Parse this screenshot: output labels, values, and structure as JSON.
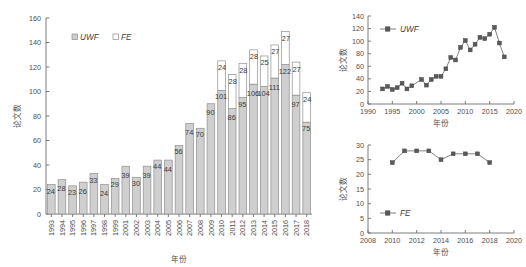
{
  "chart_data": [
    {
      "id": "stacked-bar",
      "type": "bar",
      "title": "",
      "stacked": true,
      "xlabel": "年份",
      "ylabel": "论文数",
      "ylim": [
        0,
        160
      ],
      "yticks": [
        0,
        20,
        40,
        60,
        80,
        100,
        120,
        140,
        160
      ],
      "grid": false,
      "legend": [
        "UWF",
        "FE"
      ],
      "legend_position": "top-left",
      "categories": [
        "1993",
        "1994",
        "1995",
        "1996",
        "1997",
        "1998",
        "1999",
        "2001",
        "2002",
        "2003",
        "2004",
        "2005",
        "2006",
        "2007",
        "2008",
        "2009",
        "2010",
        "2011",
        "2012",
        "2013",
        "2014",
        "2015",
        "2016",
        "2017",
        "2018"
      ],
      "series": [
        {
          "name": "UWF",
          "values": [
            24,
            28,
            23,
            26,
            33,
            24,
            29,
            39,
            30,
            39,
            44,
            44,
            56,
            74,
            70,
            90,
            101,
            86,
            95,
            106,
            104,
            111,
            122,
            97,
            75
          ],
          "labels": [
            "24",
            "28",
            "23",
            "26",
            "33",
            "24",
            "29",
            "39",
            "30",
            "39",
            "44",
            "44",
            "56",
            "74",
            "70",
            "90",
            "101",
            "86",
            "95",
            "106",
            "104",
            "111",
            "122",
            "97",
            "75"
          ]
        },
        {
          "name": "FE",
          "values": [
            0,
            0,
            0,
            0,
            0,
            0,
            0,
            0,
            0,
            0,
            0,
            0,
            0,
            0,
            0,
            0,
            24,
            28,
            28,
            28,
            25,
            27,
            27,
            27,
            24
          ],
          "labels": [
            "",
            "",
            "",
            "",
            "",
            "",
            "",
            "",
            "",
            "",
            "",
            "",
            "",
            "",
            "",
            "",
            "24",
            "28",
            "28",
            "28",
            "25",
            "27",
            "27",
            "27",
            "24"
          ]
        }
      ]
    },
    {
      "id": "uwf-line",
      "type": "line",
      "title": "",
      "xlabel": "年份",
      "ylabel": "论文数",
      "xlim": [
        1990,
        2020
      ],
      "ylim": [
        0,
        140
      ],
      "xticks": [
        1990,
        1995,
        2000,
        2005,
        2010,
        2015,
        2020
      ],
      "yticks": [
        0,
        20,
        40,
        60,
        80,
        100,
        120,
        140
      ],
      "grid": false,
      "legend": [
        "UWF"
      ],
      "legend_position": "top-left",
      "x": [
        1993,
        1994,
        1995,
        1996,
        1997,
        1998,
        1999,
        2001,
        2002,
        2003,
        2004,
        2005,
        2006,
        2007,
        2008,
        2009,
        2010,
        2011,
        2012,
        2013,
        2014,
        2015,
        2016,
        2017,
        2018
      ],
      "series": [
        {
          "name": "UWF",
          "values": [
            24,
            28,
            23,
            26,
            33,
            24,
            29,
            39,
            30,
            39,
            44,
            44,
            56,
            74,
            70,
            90,
            101,
            86,
            95,
            106,
            104,
            111,
            122,
            97,
            75
          ]
        }
      ]
    },
    {
      "id": "fe-line",
      "type": "line",
      "title": "",
      "xlabel": "年份",
      "ylabel": "论文数",
      "xlim": [
        2008,
        2020
      ],
      "ylim": [
        0,
        30
      ],
      "xticks": [
        2008,
        2010,
        2012,
        2014,
        2016,
        2018,
        2020
      ],
      "yticks": [
        0,
        5,
        10,
        15,
        20,
        25,
        30
      ],
      "grid": false,
      "legend": [
        "FE"
      ],
      "legend_position": "bottom-left",
      "x": [
        2010,
        2011,
        2012,
        2013,
        2014,
        2015,
        2016,
        2017,
        2018
      ],
      "series": [
        {
          "name": "FE",
          "values": [
            24,
            28,
            28,
            28,
            25,
            27,
            27,
            27,
            24
          ]
        }
      ]
    }
  ],
  "left_chart": {
    "ylabel": "论文数",
    "xlabel": "年份",
    "legend_uwf": "UWF",
    "legend_fe": "FE"
  },
  "top_right_chart": {
    "ylabel": "论文数",
    "xlabel": "年份",
    "legend_uwf": "UWF"
  },
  "bottom_right_chart": {
    "ylabel": "论文数",
    "xlabel": "年份",
    "legend_fe": "FE"
  },
  "colors": {
    "uwf_fill": "#cfcfcf",
    "fe_fill": "#ffffff",
    "stroke": "#8f8f8f",
    "axis": "#6e6e6e",
    "text": "#4a4a4a",
    "marker": "#5a5a5a",
    "background": "#ffffff"
  }
}
